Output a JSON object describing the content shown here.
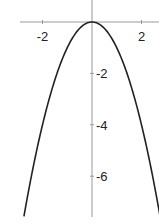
{
  "chart_data": {
    "type": "line",
    "title": "",
    "xlabel": "",
    "ylabel": "",
    "function": "y = -x^2",
    "xlim": [
      -2.85,
      2.75
    ],
    "ylim": [
      -7.7,
      0.85
    ],
    "grid": false,
    "legend": null,
    "x_ticks": [
      {
        "value": -2,
        "label": "-2"
      },
      {
        "value": 2,
        "label": "2"
      }
    ],
    "y_ticks": [
      {
        "value": -2,
        "label": "-2"
      },
      {
        "value": -4,
        "label": "-4"
      },
      {
        "value": -6,
        "label": "-6"
      }
    ],
    "series": [
      {
        "name": "y = -x^2",
        "color": "#222222",
        "x": [
          -2.75,
          -2.5,
          -2,
          -1.5,
          -1,
          -0.5,
          0,
          0.5,
          1,
          1.5,
          2,
          2.5,
          2.75
        ],
        "y": [
          -7.5625,
          -6.25,
          -4,
          -2.25,
          -1,
          -0.25,
          0,
          -0.25,
          -1,
          -2.25,
          -4,
          -6.25,
          -7.5625
        ]
      }
    ],
    "axis_color": "#999999"
  }
}
